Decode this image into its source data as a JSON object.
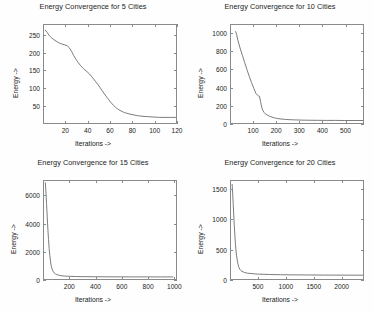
{
  "figure": {
    "background": "#fefefe",
    "axis_color": "#8a8a8a",
    "line_color": "#6b6b6b",
    "text_color": "#222222"
  },
  "chart_data": [
    {
      "type": "line",
      "title": "Energy Convergence for 5 Cities",
      "xlabel": "Iterations ->",
      "ylabel": "Energy ->",
      "xlim": [
        0,
        120
      ],
      "ylim": [
        0,
        280
      ],
      "xticks": [
        20,
        40,
        60,
        80,
        100,
        120
      ],
      "yticks": [
        50,
        100,
        150,
        200,
        250
      ],
      "grid": false,
      "legend": null,
      "series": [
        {
          "name": "energy",
          "x": [
            1,
            3,
            5,
            7,
            9,
            11,
            13,
            15,
            17,
            19,
            21,
            23,
            25,
            27,
            29,
            31,
            33,
            35,
            37,
            39,
            41,
            43,
            45,
            47,
            49,
            51,
            53,
            55,
            57,
            59,
            61,
            63,
            65,
            67,
            69,
            71,
            73,
            75,
            80,
            85,
            90,
            95,
            100,
            105,
            110,
            115,
            120
          ],
          "y": [
            266,
            258,
            249,
            243,
            238,
            234,
            230,
            227,
            225,
            223,
            221,
            215,
            205,
            193,
            182,
            173,
            165,
            158,
            152,
            147,
            141,
            134,
            126,
            118,
            110,
            101,
            92,
            83,
            74,
            66,
            58,
            51,
            45,
            40,
            36,
            33,
            30,
            28,
            24,
            21,
            19,
            18,
            17,
            16,
            16,
            16,
            16
          ]
        }
      ]
    },
    {
      "type": "line",
      "title": "Energy Convergence for 10 Cities",
      "xlabel": "Iterations ->",
      "ylabel": "Energy ->",
      "xlim": [
        0,
        580
      ],
      "ylim": [
        0,
        1100
      ],
      "xticks": [
        100,
        200,
        300,
        400,
        500
      ],
      "yticks": [
        0,
        200,
        400,
        600,
        800,
        1000
      ],
      "grid": false,
      "legend": null,
      "series": [
        {
          "name": "energy",
          "x": [
            20,
            25,
            30,
            40,
            50,
            60,
            70,
            80,
            90,
            100,
            110,
            115,
            120,
            125,
            130,
            135,
            140,
            145,
            150,
            160,
            170,
            180,
            190,
            200,
            220,
            240,
            260,
            280,
            300,
            340,
            380,
            420,
            460,
            500,
            540,
            580
          ],
          "y": [
            1030,
            990,
            930,
            840,
            760,
            680,
            600,
            525,
            455,
            390,
            330,
            315,
            305,
            300,
            240,
            175,
            140,
            120,
            105,
            88,
            75,
            66,
            58,
            52,
            45,
            40,
            37,
            35,
            33,
            31,
            30,
            29,
            29,
            28,
            28,
            28
          ]
        }
      ]
    },
    {
      "type": "line",
      "title": "Energy Convergence for 15 Cities",
      "xlabel": "Iterations ->",
      "ylabel": "Energy ->",
      "xlim": [
        0,
        1020
      ],
      "ylim": [
        0,
        7100
      ],
      "xticks": [
        200,
        400,
        600,
        800,
        1000
      ],
      "yticks": [
        0,
        2000,
        4000,
        6000
      ],
      "grid": false,
      "legend": null,
      "series": [
        {
          "name": "energy",
          "x": [
            10,
            15,
            20,
            25,
            30,
            35,
            40,
            45,
            50,
            55,
            60,
            70,
            80,
            90,
            100,
            120,
            140,
            160,
            180,
            200,
            250,
            300,
            400,
            500,
            600,
            700,
            800,
            900,
            1000
          ],
          "y": [
            7000,
            6300,
            5400,
            4500,
            3600,
            2850,
            2200,
            1700,
            1300,
            1000,
            800,
            560,
            430,
            360,
            315,
            260,
            230,
            212,
            200,
            192,
            178,
            170,
            162,
            158,
            155,
            153,
            152,
            151,
            150
          ]
        }
      ]
    },
    {
      "type": "line",
      "title": "Energy Convergence for 20 Cities",
      "xlabel": "Iterations ->",
      "ylabel": "Energy ->",
      "xlim": [
        0,
        2400
      ],
      "ylim": [
        0,
        1650
      ],
      "xticks": [
        500,
        1000,
        1500,
        2000
      ],
      "yticks": [
        0,
        500,
        1000,
        1500
      ],
      "grid": false,
      "legend": null,
      "series": [
        {
          "name": "energy",
          "x": [
            20,
            30,
            40,
            50,
            60,
            70,
            80,
            90,
            100,
            120,
            140,
            160,
            180,
            200,
            250,
            300,
            400,
            500,
            700,
            900,
            1100,
            1400,
            1700,
            2000,
            2400
          ],
          "y": [
            1600,
            1450,
            1270,
            1080,
            900,
            740,
            600,
            490,
            400,
            280,
            205,
            165,
            142,
            128,
            108,
            98,
            88,
            82,
            76,
            72,
            70,
            68,
            66,
            65,
            64
          ]
        }
      ]
    }
  ]
}
